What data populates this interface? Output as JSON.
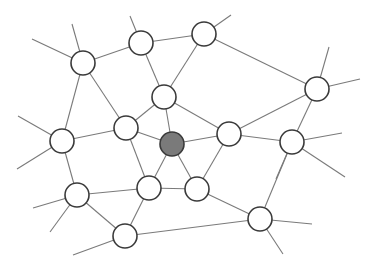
{
  "diagram": {
    "type": "network-graph",
    "background": "#ffffff",
    "node_radius": 12,
    "colors": {
      "node_fill": "#ffffff",
      "node_stroke": "#3a3a3a",
      "highlight_fill": "#7a7a7a",
      "edge": "#7a7a7a"
    },
    "nodes": [
      {
        "id": "A",
        "x": 83,
        "y": 63,
        "highlight": false
      },
      {
        "id": "B",
        "x": 141,
        "y": 43,
        "highlight": false
      },
      {
        "id": "C",
        "x": 204,
        "y": 34,
        "highlight": false
      },
      {
        "id": "D",
        "x": 164,
        "y": 97,
        "highlight": false
      },
      {
        "id": "E",
        "x": 126,
        "y": 128,
        "highlight": false
      },
      {
        "id": "F",
        "x": 172,
        "y": 144,
        "highlight": true
      },
      {
        "id": "G",
        "x": 229,
        "y": 134,
        "highlight": false
      },
      {
        "id": "H",
        "x": 317,
        "y": 89,
        "highlight": false
      },
      {
        "id": "I",
        "x": 292,
        "y": 142,
        "highlight": false
      },
      {
        "id": "J",
        "x": 62,
        "y": 141,
        "highlight": false
      },
      {
        "id": "K",
        "x": 77,
        "y": 195,
        "highlight": false
      },
      {
        "id": "L",
        "x": 149,
        "y": 188,
        "highlight": false
      },
      {
        "id": "M",
        "x": 197,
        "y": 189,
        "highlight": false
      },
      {
        "id": "N",
        "x": 260,
        "y": 219,
        "highlight": false
      },
      {
        "id": "O",
        "x": 125,
        "y": 236,
        "highlight": false
      }
    ],
    "edges": [
      [
        "A",
        "B"
      ],
      [
        "B",
        "C"
      ],
      [
        "B",
        "D"
      ],
      [
        "C",
        "D"
      ],
      [
        "C",
        "H"
      ],
      [
        "A",
        "E"
      ],
      [
        "A",
        "J"
      ],
      [
        "D",
        "E"
      ],
      [
        "D",
        "F"
      ],
      [
        "D",
        "G"
      ],
      [
        "E",
        "F"
      ],
      [
        "E",
        "J"
      ],
      [
        "E",
        "L"
      ],
      [
        "F",
        "G"
      ],
      [
        "F",
        "L"
      ],
      [
        "F",
        "M"
      ],
      [
        "G",
        "H"
      ],
      [
        "G",
        "M"
      ],
      [
        "G",
        "I"
      ],
      [
        "H",
        "I"
      ],
      [
        "I",
        "N"
      ],
      [
        "J",
        "K"
      ],
      [
        "K",
        "L"
      ],
      [
        "K",
        "O"
      ],
      [
        "L",
        "M"
      ],
      [
        "L",
        "O"
      ],
      [
        "M",
        "N"
      ],
      [
        "O",
        "N"
      ]
    ],
    "stubs": [
      {
        "from": "A",
        "x2": 32,
        "y2": 39
      },
      {
        "from": "A",
        "x2": 72,
        "y2": 24
      },
      {
        "from": "B",
        "x2": 130,
        "y2": 16
      },
      {
        "from": "C",
        "x2": 231,
        "y2": 15
      },
      {
        "from": "H",
        "x2": 329,
        "y2": 47
      },
      {
        "from": "H",
        "x2": 360,
        "y2": 79
      },
      {
        "from": "I",
        "x2": 342,
        "y2": 133
      },
      {
        "from": "I",
        "x2": 345,
        "y2": 177
      },
      {
        "from": "I",
        "x2": 276,
        "y2": 179
      },
      {
        "from": "J",
        "x2": 18,
        "y2": 116
      },
      {
        "from": "J",
        "x2": 17,
        "y2": 169
      },
      {
        "from": "K",
        "x2": 33,
        "y2": 208
      },
      {
        "from": "K",
        "x2": 50,
        "y2": 232
      },
      {
        "from": "O",
        "x2": 73,
        "y2": 255
      },
      {
        "from": "N",
        "x2": 312,
        "y2": 224
      },
      {
        "from": "N",
        "x2": 283,
        "y2": 254
      }
    ]
  }
}
